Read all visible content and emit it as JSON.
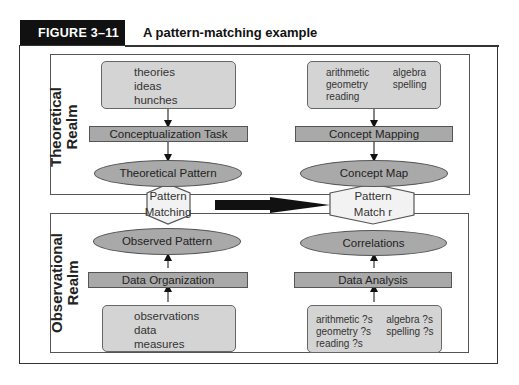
{
  "figure": {
    "label": "FIGURE 3–11",
    "title": "A pattern-matching example"
  },
  "theoretical_realm": {
    "label_line1": "Theoretical",
    "label_line2": "Realm",
    "left": {
      "source_items": [
        "theories",
        "ideas",
        "hunches"
      ],
      "process": "Conceptualization Task",
      "pattern": "Theoretical Pattern"
    },
    "right": {
      "source_items": [
        "arithmetic",
        "algebra",
        "geometry",
        "spelling",
        "reading"
      ],
      "process": "Concept Mapping",
      "pattern": "Concept Map"
    }
  },
  "matching": {
    "left_line1": "Pattern",
    "left_line2": "Matching",
    "right_line1": "Pattern",
    "right_line2": "Match r",
    "arrow_direction": "right"
  },
  "observational_realm": {
    "label_line1": "Observational",
    "label_line2": "Realm",
    "left": {
      "pattern": "Observed Pattern",
      "process": "Data Organization",
      "source_items": [
        "observations",
        "data",
        "measures"
      ]
    },
    "right": {
      "pattern": "Correlations",
      "process": "Data Analysis",
      "source_items": [
        "arithmetic ?s",
        "algebra ?s",
        "geometry ?s",
        "spelling ?s",
        "reading ?s"
      ]
    }
  },
  "colors": {
    "header_bg": "#111111",
    "rounded_box_fill": "#d4d4d4",
    "process_fill": "#a9a9a9",
    "hexagon_fill": "#f2f2f2",
    "stroke": "#555555"
  }
}
